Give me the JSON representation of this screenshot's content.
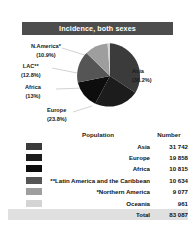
{
  "header": {
    "title": "Incidence, both sexes"
  },
  "chart_data": {
    "type": "pie",
    "title": "Incidence, both sexes",
    "categories": [
      "Asia",
      "Europe",
      "Africa",
      "Latin America and the Caribbean",
      "Northern America",
      "Oceania"
    ],
    "values": [
      31742,
      19858,
      10815,
      10634,
      9077,
      961
    ],
    "percentages": [
      38.2,
      23.8,
      13.0,
      12.8,
      10.9,
      1.2
    ],
    "total": 83087,
    "legend_position": "below",
    "slice_colors": [
      "#3b3b3b",
      "#1c1c1c",
      "#0d0d0d",
      "#555555",
      "#9e9e9e",
      "#d4d4d4"
    ],
    "labels": [
      {
        "name": "Asia",
        "pct": "(38.2%)"
      },
      {
        "name": "Europe",
        "pct": "(23.8%)"
      },
      {
        "name": "Africa",
        "pct": "(13%)"
      },
      {
        "name": "LAC**",
        "pct": "(12.8%)"
      },
      {
        "name": "N.America*",
        "pct": "(10.9%)"
      }
    ]
  },
  "pie_labels": {
    "namerica": {
      "name": "N.America*",
      "pct": "(10.9%)"
    },
    "lac": {
      "name": "LAC**",
      "pct": "(12.8%)"
    },
    "africa": {
      "name": "Africa",
      "pct": "(13%)"
    },
    "europe": {
      "name": "Europe",
      "pct": "(23.8%)"
    },
    "asia": {
      "name": "Asia",
      "pct": "(38.2%)"
    }
  },
  "table": {
    "headers": {
      "swatch": "",
      "population": "Population",
      "number": "Number"
    },
    "rows": [
      {
        "color": "#3b3b3b",
        "population": "Asia",
        "number": "31 742"
      },
      {
        "color": "#1c1c1c",
        "population": "Europe",
        "number": "19 858"
      },
      {
        "color": "#0d0d0d",
        "population": "Africa",
        "number": "10 815"
      },
      {
        "color": "#555555",
        "population": "**Latin America and the Caribbean",
        "number": "10 634"
      },
      {
        "color": "#9e9e9e",
        "population": "*Northern America",
        "number": "9 077"
      },
      {
        "color": "#d4d4d4",
        "population": "Oceania",
        "number": "961"
      }
    ],
    "total": {
      "population": "Total",
      "number": "83 087"
    }
  }
}
